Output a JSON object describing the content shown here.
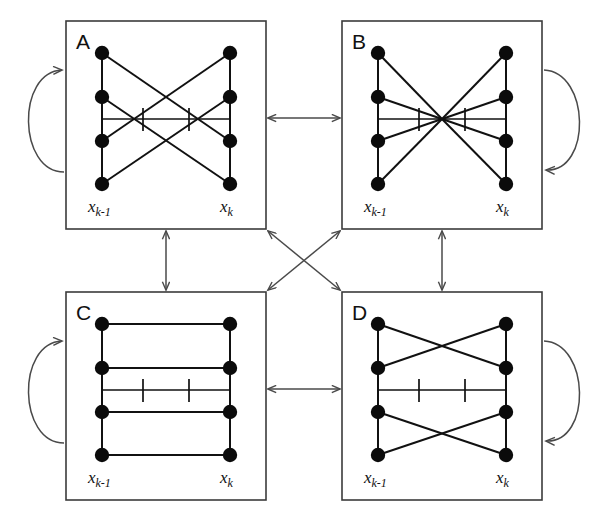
{
  "figure": {
    "background_color": "#ffffff",
    "width": 597,
    "height": 516,
    "node_color": "#0b0b0b",
    "edge_color": "#111111",
    "box_color": "#3b3b3b",
    "connector_color": "#4a4a4a"
  },
  "labels": {
    "left_axis_main": "x",
    "left_axis_sub": "k-1",
    "right_axis_main": "x",
    "right_axis_sub": "k"
  },
  "panels": [
    {
      "id": "A",
      "letter": "A",
      "position": "top-left",
      "left_label_main": "x",
      "left_label_sub": "k-1",
      "right_label_main": "x",
      "right_label_sub": "k",
      "node_count_left": 4,
      "node_count_right": 4,
      "pattern": "crossing-fan",
      "edges": "1-4, 2-3, 3-2, 4-1 diagonals plus vertical rails",
      "self_loop": "left",
      "tick_count": 2
    },
    {
      "id": "B",
      "letter": "B",
      "position": "top-right",
      "left_label_main": "x",
      "left_label_sub": "k-1",
      "right_label_main": "x",
      "right_label_sub": "k",
      "node_count_left": 4,
      "node_count_right": 4,
      "pattern": "full-convergence",
      "edges": "all nodes converge to single center point",
      "self_loop": "right",
      "tick_count": 2
    },
    {
      "id": "C",
      "letter": "C",
      "position": "bottom-left",
      "left_label_main": "x",
      "left_label_sub": "k-1",
      "right_label_main": "x",
      "right_label_sub": "k",
      "node_count_left": 4,
      "node_count_right": 4,
      "pattern": "parallel-identity",
      "edges": "4 horizontal parallel edges, no crossings",
      "self_loop": "left",
      "tick_count": 2
    },
    {
      "id": "D",
      "letter": "D",
      "position": "bottom-right",
      "left_label_main": "x",
      "left_label_sub": "k-1",
      "right_label_main": "x",
      "right_label_sub": "k",
      "node_count_left": 4,
      "node_count_right": 4,
      "pattern": "double-crossing",
      "edges": "top pair crosses, bottom pair crosses",
      "self_loop": "right",
      "tick_count": 2
    }
  ],
  "connectors": [
    {
      "id": "a-b",
      "from": "A",
      "to": "B",
      "orientation": "horizontal",
      "arrows": "both"
    },
    {
      "id": "c-d",
      "from": "C",
      "to": "D",
      "orientation": "horizontal",
      "arrows": "both"
    },
    {
      "id": "a-c",
      "from": "A",
      "to": "C",
      "orientation": "vertical",
      "arrows": "both"
    },
    {
      "id": "b-d",
      "from": "B",
      "to": "D",
      "orientation": "vertical",
      "arrows": "both"
    },
    {
      "id": "a-d",
      "from": "A",
      "to": "D",
      "orientation": "diagonal",
      "arrows": "both"
    },
    {
      "id": "b-c",
      "from": "B",
      "to": "C",
      "orientation": "diagonal",
      "arrows": "both"
    }
  ],
  "self_loops": [
    {
      "id": "loop-a",
      "panel": "A",
      "side": "left",
      "arrow_at": "top"
    },
    {
      "id": "loop-b",
      "panel": "B",
      "side": "right",
      "arrow_at": "bottom"
    },
    {
      "id": "loop-c",
      "panel": "C",
      "side": "left",
      "arrow_at": "top"
    },
    {
      "id": "loop-d",
      "panel": "D",
      "side": "right",
      "arrow_at": "bottom"
    }
  ]
}
